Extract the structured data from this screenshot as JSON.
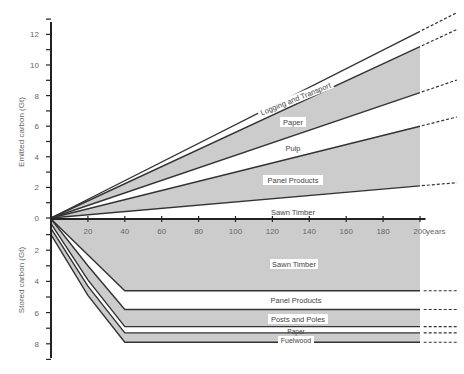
{
  "chart_data": {
    "type": "area",
    "title": "",
    "xlabel": "years",
    "x_ticks": [
      20,
      40,
      60,
      80,
      100,
      120,
      140,
      160,
      180,
      200
    ],
    "x_tick_labels": [
      "20",
      "40",
      "60",
      "80",
      "100",
      "120",
      "140",
      "160",
      "180",
      "200"
    ],
    "xlim": [
      0,
      200
    ],
    "x_end_label": "years",
    "panels": [
      {
        "name": "emitted",
        "ylabel": "Emitted carbon (Gt)",
        "yticks": [
          0,
          2,
          4,
          6,
          8,
          10,
          12
        ],
        "ylim": [
          0,
          13
        ],
        "boundaries_at_200_years": [
          {
            "name": "Sawn Timber (upper bound)",
            "value": 2.1
          },
          {
            "name": "Panel Products (upper bound)",
            "value": 6.0
          },
          {
            "name": "Pulp (upper bound)",
            "value": 8.2
          },
          {
            "name": "Paper (upper bound)",
            "value": 11.2
          },
          {
            "name": "Logging and Transport (upper bound)",
            "value": 12.2
          }
        ],
        "bands": [
          {
            "label": "Sawn Timber",
            "from": 0,
            "to": 2.1,
            "fill": "#ffffff"
          },
          {
            "label": "Panel Products",
            "from": 2.1,
            "to": 6.0,
            "fill": "#cccccc"
          },
          {
            "label": "Pulp",
            "from": 6.0,
            "to": 8.2,
            "fill": "#ffffff"
          },
          {
            "label": "Paper",
            "from": 8.2,
            "to": 11.2,
            "fill": "#cccccc"
          },
          {
            "label": "Logging and Transport",
            "from": 11.2,
            "to": 12.2,
            "fill": "#ffffff"
          }
        ],
        "note": "Lines grow linearly from 0 at year 0 and continue as dashed lines beyond 200 years"
      },
      {
        "name": "stored",
        "ylabel": "Stored carbon (Gt)",
        "yticks": [
          0,
          2,
          4,
          6,
          8
        ],
        "ylim": [
          0,
          9
        ],
        "boundaries": [
          {
            "name": "Sawn Timber (lower bound)",
            "points": [
              [
                0,
                0
              ],
              [
                40,
                4.6
              ],
              [
                200,
                4.6
              ]
            ]
          },
          {
            "name": "Panel Products (lower bound)",
            "points": [
              [
                0,
                0
              ],
              [
                20,
                3.0
              ],
              [
                40,
                5.8
              ],
              [
                200,
                5.8
              ]
            ]
          },
          {
            "name": "Posts and Poles (lower bound)",
            "points": [
              [
                0,
                0.3
              ],
              [
                20,
                3.9
              ],
              [
                40,
                6.9
              ],
              [
                200,
                6.9
              ]
            ]
          },
          {
            "name": "Paper (lower bound)",
            "points": [
              [
                0,
                0.6
              ],
              [
                20,
                4.3
              ],
              [
                40,
                7.3
              ],
              [
                200,
                7.3
              ]
            ]
          },
          {
            "name": "Fuelwood (lower bound)",
            "points": [
              [
                0,
                1.0
              ],
              [
                20,
                4.9
              ],
              [
                40,
                7.9
              ],
              [
                200,
                7.9
              ]
            ]
          }
        ],
        "bands": [
          {
            "label": "Sawn Timber",
            "level": 4.6,
            "fill": "#cccccc"
          },
          {
            "label": "Panel Products",
            "level": 5.8,
            "fill": "#ffffff"
          },
          {
            "label": "Posts and Poles",
            "level": 6.9,
            "fill": "#cccccc"
          },
          {
            "label": "Paper",
            "level": 7.3,
            "fill": "#ffffff"
          },
          {
            "label": "Fuelwood",
            "level": 7.9,
            "fill": "#cccccc"
          }
        ],
        "note": "Stored carbon plateaus after 40 years; dashed lines continue beyond 200 years"
      }
    ],
    "colors": {
      "line": "#333333",
      "band_gray": "#cccccc",
      "band_white": "#ffffff",
      "axis": "#222222"
    }
  },
  "labels": {
    "emitted_ylabel": "Emitted carbon (Gt)",
    "stored_ylabel": "Stored carbon (Gt)",
    "years": "years",
    "e_sawn": "Sawn Timber",
    "e_panel": "Panel Products",
    "e_pulp": "Pulp",
    "e_paper": "Paper",
    "e_logging": "Logging and Transport",
    "s_sawn": "Sawn Timber",
    "s_panel": "Panel Products",
    "s_posts": "Posts and Poles",
    "s_paper": "Paper",
    "s_fuel": "Fuelwood"
  }
}
